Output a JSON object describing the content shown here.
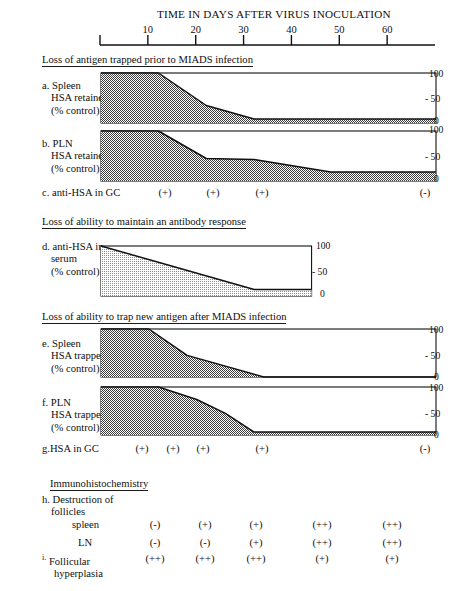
{
  "figure": {
    "title": "TIME IN DAYS AFTER VIRUS INOCULATION",
    "axis": {
      "label": "TIME IN DAYS AFTER VIRUS INOCULATION",
      "ticks": [
        10,
        20,
        30,
        40,
        50,
        60
      ],
      "range": [
        0,
        70
      ],
      "tick_labels": [
        "10",
        "20",
        "30",
        "40",
        "50",
        "60"
      ]
    },
    "sections": [
      {
        "id": "s1",
        "text": "Loss of antigen trapped prior to MIADS infection"
      },
      {
        "id": "s2",
        "text": "Loss of ability to maintain an antibody response"
      },
      {
        "id": "s3",
        "text": "Loss of ability to trap new antigen after MIADS infection"
      },
      {
        "id": "s4",
        "text": "Immunohistochemistry"
      }
    ],
    "rows": {
      "a": {
        "key": "a.",
        "lines": [
          "Spleen",
          "HSA retained",
          "(% control)"
        ]
      },
      "b": {
        "key": "b.",
        "lines": [
          "PLN",
          "HSA retained",
          "(% control)"
        ]
      },
      "c": {
        "key": "c.",
        "lines": [
          "anti-HSA in GC"
        ]
      },
      "d": {
        "key": "d.",
        "lines": [
          "anti-HSA in",
          "serum",
          "(% control)"
        ]
      },
      "e": {
        "key": "e.",
        "lines": [
          "Spleen",
          "HSA trapped",
          "(% control)"
        ]
      },
      "f": {
        "key": "f.",
        "lines": [
          "PLN",
          "HSA trapped",
          "(% control)"
        ]
      },
      "g": {
        "key": "g.",
        "lines": [
          "HSA in GC"
        ]
      },
      "h": {
        "key": "h.",
        "lines": [
          "Destruction of",
          "follicles"
        ],
        "sub": [
          "spleen",
          "LN"
        ]
      },
      "i": {
        "key": "i.",
        "lines": [
          "Follicular",
          "hyperplasia"
        ]
      }
    },
    "y_axis_values": {
      "top": "100",
      "mid": "- 50",
      "bottom": "0"
    },
    "scores": {
      "c_anti_hsa_in_gc": [
        {
          "value": "(+)",
          "x": 165
        },
        {
          "value": "(+)",
          "x": 213
        },
        {
          "value": "(+)",
          "x": 262
        },
        {
          "value": "(-)",
          "x": 425
        }
      ],
      "g_hsa_in_gc": [
        {
          "value": "(+)",
          "x": 142
        },
        {
          "value": "(+)",
          "x": 173
        },
        {
          "value": "(+)",
          "x": 203
        },
        {
          "value": "(+)",
          "x": 262
        },
        {
          "value": "(-)",
          "x": 425
        }
      ],
      "h_spleen": [
        "(-)",
        "(+)",
        "(+)",
        "(++)",
        "(++)"
      ],
      "h_ln": [
        "(-)",
        "(-)",
        "(+)",
        "(++)",
        "(++)"
      ],
      "i_follicular_hyperplasia": [
        "(++)",
        "(++)",
        "(++)",
        "(+)",
        "(+)"
      ]
    },
    "score_columns_x": [
      155,
      205,
      256,
      322,
      392
    ]
  },
  "chart_data": [
    {
      "id": "a",
      "type": "area",
      "title": "a. Spleen HSA retained (% control)",
      "xlabel": "TIME IN DAYS AFTER VIRUS INOCULATION",
      "ylabel": "HSA retained (% control)",
      "ylim": [
        0,
        100
      ],
      "xlim": [
        0,
        70
      ],
      "fill": "dark-checker",
      "x": [
        0,
        12,
        22,
        32,
        70
      ],
      "y": [
        100,
        100,
        35,
        8,
        8
      ]
    },
    {
      "id": "b",
      "type": "area",
      "title": "b. PLN HSA retained (% control)",
      "ylabel": "HSA retained (% control)",
      "ylim": [
        0,
        100
      ],
      "xlim": [
        0,
        70
      ],
      "fill": "dark-checker",
      "x": [
        0,
        12,
        22,
        32,
        48,
        70
      ],
      "y": [
        100,
        100,
        45,
        43,
        18,
        18
      ]
    },
    {
      "id": "d",
      "type": "area",
      "title": "d. anti-HSA in serum (% control)",
      "ylabel": "anti-HSA in serum (% control)",
      "ylim": [
        0,
        100
      ],
      "xlim": [
        0,
        44
      ],
      "fill": "light-checker",
      "x": [
        0,
        14,
        32,
        44
      ],
      "y": [
        100,
        62,
        13,
        13
      ]
    },
    {
      "id": "e",
      "type": "area",
      "title": "e. Spleen HSA trapped (% control)",
      "ylabel": "HSA trapped (% control)",
      "ylim": [
        0,
        100
      ],
      "xlim": [
        0,
        70
      ],
      "fill": "dark-checker",
      "x": [
        0,
        10,
        18,
        34,
        70
      ],
      "y": [
        100,
        100,
        45,
        0,
        0
      ]
    },
    {
      "id": "f",
      "type": "area",
      "title": "f. PLN HSA trapped (% control)",
      "ylabel": "HSA trapped (% control)",
      "ylim": [
        0,
        100
      ],
      "xlim": [
        0,
        70
      ],
      "fill": "dark-checker",
      "x": [
        0,
        12,
        20,
        26,
        32,
        70
      ],
      "y": [
        100,
        100,
        74,
        45,
        6,
        6
      ]
    }
  ]
}
